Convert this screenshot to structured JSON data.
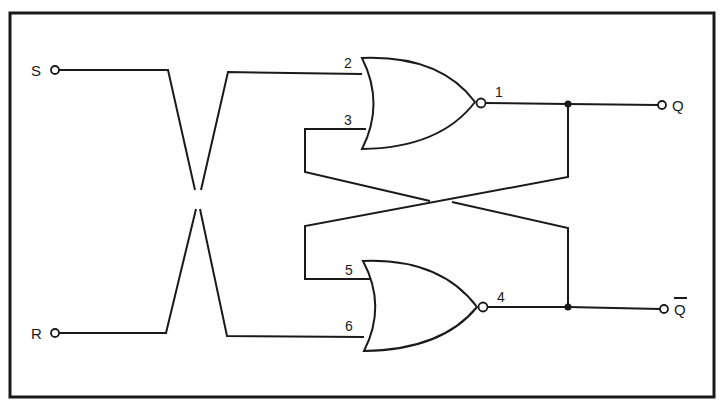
{
  "diagram": {
    "type": "SR latch (cross-coupled NOR gates)",
    "inputs": [
      {
        "label": "S",
        "id": "S"
      },
      {
        "label": "R",
        "id": "R"
      }
    ],
    "outputs": [
      {
        "label": "Q",
        "id": "Q"
      },
      {
        "label": "Q",
        "id": "Q_bar",
        "overline": true
      }
    ],
    "gates": [
      {
        "type": "NOR",
        "name": "upper",
        "input_pins": [
          "2",
          "3"
        ],
        "output_pin": "1"
      },
      {
        "type": "NOR",
        "name": "lower",
        "input_pins": [
          "5",
          "6"
        ],
        "output_pin": "4"
      }
    ],
    "pins": {
      "p1": "1",
      "p2": "2",
      "p3": "3",
      "p4": "4",
      "p5": "5",
      "p6": "6"
    },
    "labels": {
      "s": "S",
      "r": "R",
      "q": "Q",
      "qbar": "Q"
    },
    "colors": {
      "ink": "#1a1a1a",
      "background": "#ffffff"
    }
  }
}
